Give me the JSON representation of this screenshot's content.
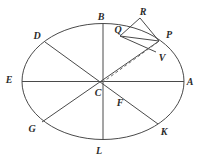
{
  "figure": {
    "kind": "geometry-diagram",
    "background_color": "#ffffff",
    "stroke_color": "#4a4a4a",
    "label_color": "#2b2b2b",
    "canvas": {
      "width": 207,
      "height": 162
    }
  },
  "ellipse": {
    "name": "main-ellipse",
    "cx": 103,
    "cy": 81.5,
    "rx": 81,
    "ry": 58
  },
  "points": [
    {
      "id": "A",
      "label": "A",
      "label_x": 190,
      "label_y": 82,
      "x": 184,
      "y": 81.5
    },
    {
      "id": "B",
      "label": "B",
      "label_x": 101,
      "label_y": 17,
      "x": 103,
      "y": 23.5
    },
    {
      "id": "C",
      "label": "C",
      "label_x": 98,
      "label_y": 93,
      "x": 103,
      "y": 81.5
    },
    {
      "id": "D",
      "label": "D",
      "label_x": 37,
      "label_y": 36,
      "x": 45,
      "y": 42
    },
    {
      "id": "E",
      "label": "E",
      "label_x": 9,
      "label_y": 80,
      "x": 22,
      "y": 81.5
    },
    {
      "id": "F",
      "label": "F",
      "label_x": 120,
      "label_y": 103,
      "x": 127,
      "y": 95
    },
    {
      "id": "G",
      "label": "G",
      "label_x": 32,
      "label_y": 129,
      "x": 42,
      "y": 122
    },
    {
      "id": "K",
      "label": "K",
      "label_x": 164,
      "label_y": 132,
      "x": 158,
      "y": 124
    },
    {
      "id": "L",
      "label": "L",
      "label_x": 99,
      "label_y": 151,
      "x": 103,
      "y": 139.5
    },
    {
      "id": "P",
      "label": "P",
      "label_x": 169,
      "label_y": 35,
      "x": 159,
      "y": 41
    },
    {
      "id": "Q",
      "label": "Q",
      "label_x": 118,
      "label_y": 30,
      "x": 120,
      "y": 36
    },
    {
      "id": "R",
      "label": "R",
      "label_x": 143,
      "label_y": 12,
      "x": 140,
      "y": 18
    },
    {
      "id": "V",
      "label": "V",
      "label_x": 162,
      "label_y": 58,
      "x": 156,
      "y": 52
    }
  ],
  "segments": [
    {
      "name": "segment-E-A",
      "from": "E",
      "to": "A",
      "style": "solid"
    },
    {
      "name": "segment-B-L",
      "from": "B",
      "to": "L",
      "style": "solid"
    },
    {
      "name": "segment-D-K",
      "from": "D",
      "to": "K",
      "style": "solid"
    },
    {
      "name": "segment-G-P",
      "from": "G",
      "to": "P",
      "style": "solid"
    },
    {
      "name": "segment-Q-P",
      "from": "Q",
      "to": "P",
      "style": "solid"
    },
    {
      "name": "segment-Q-V",
      "from": "Q",
      "to": "V",
      "style": "solid"
    },
    {
      "name": "segment-R-P",
      "from": "R",
      "to": "P",
      "style": "solid"
    },
    {
      "name": "segment-R-Q",
      "from": "R",
      "to": "Q",
      "style": "solid"
    },
    {
      "name": "segment-P-C-dashed",
      "from": "P",
      "to": "C",
      "style": "dashed"
    }
  ]
}
